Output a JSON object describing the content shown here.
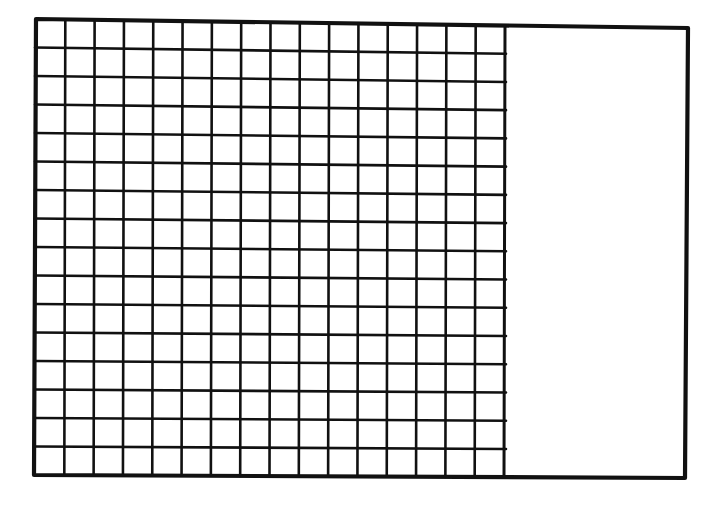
{
  "diagram": {
    "title": "",
    "grid": {
      "rows": 16,
      "columns": 16,
      "total_squares": 256,
      "shaded_squares": 0
    },
    "empty_region": {
      "filled": false
    },
    "colors": {
      "line": "#111111",
      "background": "#ffffff"
    }
  }
}
